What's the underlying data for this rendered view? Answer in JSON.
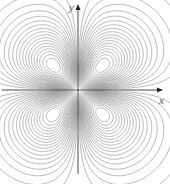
{
  "figure": {
    "axes": {
      "x_label": "x",
      "y_label": "y"
    },
    "colors": {
      "contour": "#8a8a8a",
      "axis": "#333333",
      "shade": "#9a9a9a"
    },
    "layout": {
      "origin": [
        78,
        90
      ],
      "lobe_centers": [
        [
          54,
          66
        ],
        [
          102,
          66
        ],
        [
          54,
          114
        ],
        [
          102,
          114
        ]
      ],
      "x_axis_extent": [
        2,
        163
      ],
      "y_axis_extent": [
        4,
        174
      ],
      "contour_levels": 18
    }
  }
}
